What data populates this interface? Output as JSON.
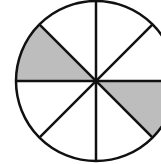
{
  "diagram": {
    "type": "fraction-circle",
    "total_sectors": 8,
    "shaded_sectors": 2,
    "shaded_positions": [
      "upper-left (between 135° and 180°)",
      "lower-right (between 315° and 360°)"
    ],
    "colors": {
      "shade": "#bdbdbd",
      "line": "#111111",
      "background": "#ffffff"
    }
  }
}
